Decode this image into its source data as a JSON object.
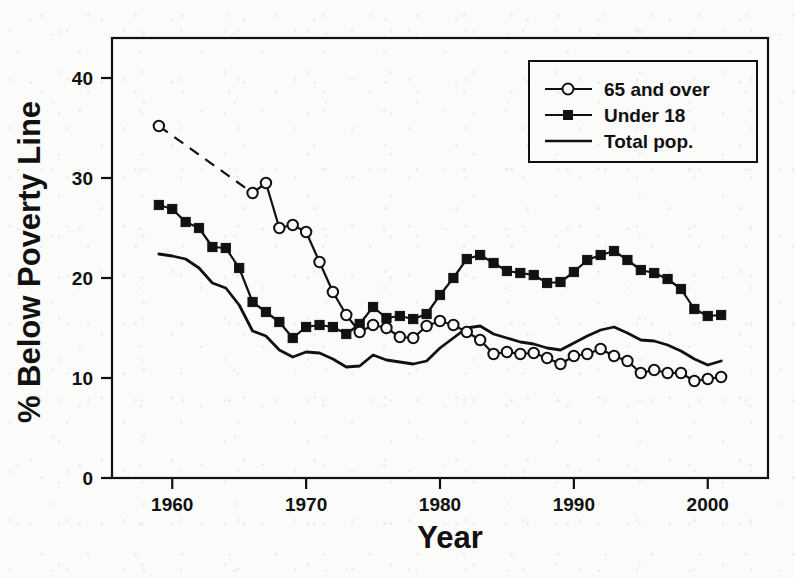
{
  "chart_data": {
    "type": "line",
    "title": "",
    "subtitle": "",
    "xlabel": "Year",
    "ylabel": "% Below Poverty Line",
    "xlim": [
      1955.5,
      2004.5
    ],
    "ylim": [
      0,
      44
    ],
    "xticks": [
      1960,
      1970,
      1980,
      1990,
      2000
    ],
    "xtick_labels": [
      "1960",
      "1970",
      "1980",
      "1990",
      "2000"
    ],
    "yticks": [
      0,
      10,
      20,
      30,
      40
    ],
    "ytick_labels": [
      "0",
      "10",
      "20",
      "30",
      "40"
    ],
    "grid": false,
    "frame": "box",
    "legend_position": "top-right",
    "legend_entries": [
      "65 and over",
      "Under 18",
      "Total pop."
    ],
    "series": [
      {
        "name": "65 and over",
        "marker": "open-circle",
        "line": "solid-with-dashed-gap",
        "dashed_segment_years": [
          1959,
          1966
        ],
        "x": [
          1959,
          1966,
          1967,
          1968,
          1969,
          1970,
          1971,
          1972,
          1973,
          1974,
          1975,
          1976,
          1977,
          1978,
          1979,
          1980,
          1981,
          1982,
          1983,
          1984,
          1985,
          1986,
          1987,
          1988,
          1989,
          1990,
          1991,
          1992,
          1993,
          1994,
          1995,
          1996,
          1997,
          1998,
          1999,
          2000,
          2001
        ],
        "y": [
          35.2,
          28.5,
          29.5,
          25.0,
          25.3,
          24.6,
          21.6,
          18.6,
          16.3,
          14.6,
          15.3,
          15.0,
          14.1,
          14.0,
          15.2,
          15.7,
          15.3,
          14.6,
          13.8,
          12.4,
          12.6,
          12.4,
          12.5,
          12.0,
          11.4,
          12.2,
          12.4,
          12.9,
          12.2,
          11.7,
          10.5,
          10.8,
          10.5,
          10.5,
          9.7,
          9.9,
          10.1
        ]
      },
      {
        "name": "Under 18",
        "marker": "filled-square",
        "line": "solid",
        "x": [
          1959,
          1960,
          1961,
          1962,
          1963,
          1964,
          1965,
          1966,
          1967,
          1968,
          1969,
          1970,
          1971,
          1972,
          1973,
          1974,
          1975,
          1976,
          1977,
          1978,
          1979,
          1980,
          1981,
          1982,
          1983,
          1984,
          1985,
          1986,
          1987,
          1988,
          1989,
          1990,
          1991,
          1992,
          1993,
          1994,
          1995,
          1996,
          1997,
          1998,
          1999,
          2000,
          2001
        ],
        "y": [
          27.3,
          26.9,
          25.6,
          25.0,
          23.1,
          23.0,
          21.0,
          17.6,
          16.6,
          15.6,
          14.0,
          15.1,
          15.3,
          15.1,
          14.4,
          15.4,
          17.1,
          16.0,
          16.2,
          15.9,
          16.4,
          18.3,
          20.0,
          21.9,
          22.3,
          21.5,
          20.7,
          20.5,
          20.3,
          19.5,
          19.6,
          20.6,
          21.8,
          22.3,
          22.7,
          21.8,
          20.8,
          20.5,
          19.9,
          18.9,
          16.9,
          16.2,
          16.3
        ]
      },
      {
        "name": "Total pop.",
        "marker": "none",
        "line": "solid",
        "x": [
          1959,
          1960,
          1961,
          1962,
          1963,
          1964,
          1965,
          1966,
          1967,
          1968,
          1969,
          1970,
          1971,
          1972,
          1973,
          1974,
          1975,
          1976,
          1977,
          1978,
          1979,
          1980,
          1981,
          1982,
          1983,
          1984,
          1985,
          1986,
          1987,
          1988,
          1989,
          1990,
          1991,
          1992,
          1993,
          1994,
          1995,
          1996,
          1997,
          1998,
          1999,
          2000,
          2001
        ],
        "y": [
          22.4,
          22.2,
          21.9,
          21.0,
          19.5,
          19.0,
          17.3,
          14.7,
          14.2,
          12.8,
          12.1,
          12.6,
          12.5,
          11.9,
          11.1,
          11.2,
          12.3,
          11.8,
          11.6,
          11.4,
          11.7,
          13.0,
          14.0,
          15.0,
          15.2,
          14.4,
          14.0,
          13.6,
          13.4,
          13.0,
          12.8,
          13.5,
          14.2,
          14.8,
          15.1,
          14.5,
          13.8,
          13.7,
          13.3,
          12.7,
          11.9,
          11.3,
          11.7
        ]
      }
    ]
  },
  "axes": {
    "y_axis_title": "% Below Poverty Line",
    "x_axis_title": "Year"
  },
  "legend": {
    "items": [
      {
        "label": "65 and over",
        "marker": "open-circle"
      },
      {
        "label": "Under 18",
        "marker": "filled-square"
      },
      {
        "label": "Total pop.",
        "marker": "none"
      }
    ]
  },
  "ticks": {
    "x": [
      "1960",
      "1970",
      "1980",
      "1990",
      "2000"
    ],
    "y": [
      "0",
      "10",
      "20",
      "30",
      "40"
    ]
  },
  "colors": {
    "ink": "#111111",
    "paper": "#fbfbfa"
  }
}
